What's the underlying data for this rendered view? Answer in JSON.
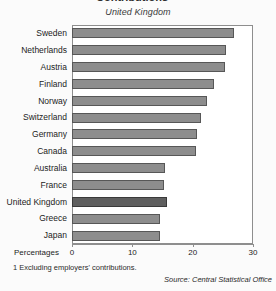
{
  "figure": {
    "clipped_heading_remnant": "Contributions",
    "footnote": "1 Excluding employers' contributions.",
    "source": "Source: Central Statistical Office"
  },
  "chart_data": {
    "type": "bar",
    "orientation": "horizontal",
    "title": "United Kingdom",
    "xlabel": "Percentages",
    "ylabel": "",
    "xlim": [
      0,
      30
    ],
    "xticks": [
      0,
      10,
      20,
      30
    ],
    "xticklabels": [
      "0",
      "10",
      "20",
      "30"
    ],
    "grid": false,
    "legend": null,
    "highlight_category": "United Kingdom",
    "categories": [
      "Sweden",
      "Netherlands",
      "Austria",
      "Finland",
      "Norway",
      "Switzerland",
      "Germany",
      "Canada",
      "Australia",
      "France",
      "United Kingdom",
      "Greece",
      "Japan"
    ],
    "values": [
      26.8,
      25.5,
      25.3,
      23.5,
      22.3,
      21.3,
      20.7,
      20.5,
      15.4,
      15.2,
      15.7,
      14.6,
      14.6
    ],
    "colors": {
      "bar": "#8d8d8d",
      "bar_edge": "#575757",
      "highlight_bar": "#5f5f5f",
      "highlight_edge": "#3a3a3a",
      "frame": "#8e8e8e",
      "background": "#fbfbfb",
      "plot_background": "#ffffff"
    }
  }
}
